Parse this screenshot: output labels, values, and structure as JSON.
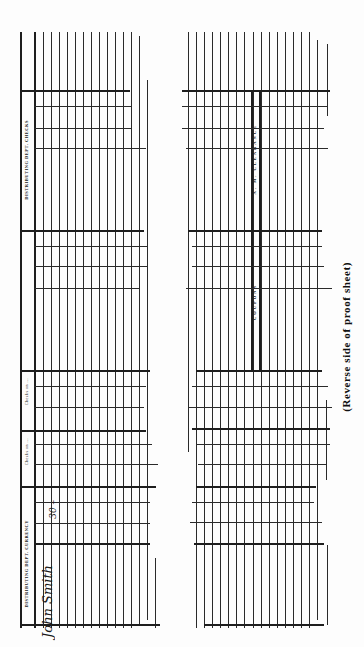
{
  "document": {
    "caption": "(Reverse side of proof sheet)",
    "left_panel": {
      "headers": [
        "DISTRIBUTING DEPT. CHECKS",
        "Checks on ...",
        "Checks on ...",
        "DISTRIBUTING DEPT. CURRENCY"
      ],
      "handwritten_signature": "John Smith",
      "handwritten_amount": "30 –"
    },
    "right_panel": {
      "labels": [
        "A. M. CLEARANCE",
        "COUPONS"
      ]
    }
  },
  "colors": {
    "ink": "#1e1e1e",
    "paper": "#fdfdfd"
  }
}
